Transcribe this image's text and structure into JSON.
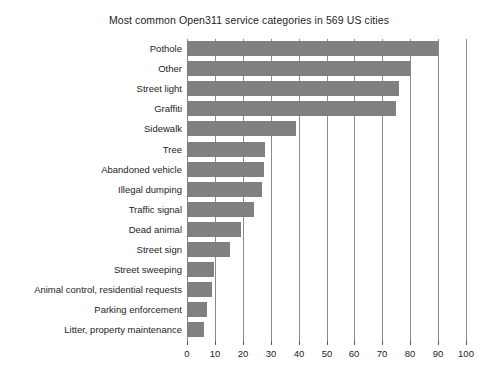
{
  "chart_data": {
    "type": "bar",
    "orientation": "horizontal",
    "title": "Most common Open311 service categories in 569 US cities",
    "xlabel": "",
    "ylabel": "",
    "xlim": [
      0,
      100
    ],
    "xticks": [
      0,
      10,
      20,
      30,
      40,
      50,
      60,
      70,
      80,
      90,
      100
    ],
    "grid": "vertical",
    "legend": "none",
    "bar_color": "#808080",
    "categories": [
      "Pothole",
      "Other",
      "Street light",
      "Graffiti",
      "Sidewalk",
      "Tree",
      "Abandoned vehicle",
      "Illegal dumping",
      "Traffic signal",
      "Dead animal",
      "Street sign",
      "Street sweeping",
      "Animal control, residential requests",
      "Parking enforcement",
      "Litter, property maintenance"
    ],
    "values": [
      90,
      80,
      76,
      75,
      39,
      28,
      27.5,
      27,
      24,
      19.5,
      15.5,
      9.5,
      9,
      7,
      6
    ]
  }
}
